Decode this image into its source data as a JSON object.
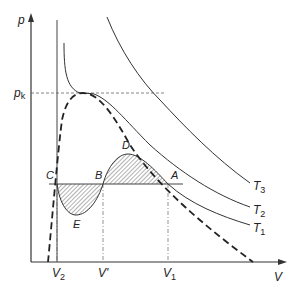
{
  "diagram": {
    "axes": {
      "y_label": "p",
      "x_label": "V",
      "pk_label": "p",
      "pk_sub": "k"
    },
    "x_ticks": [
      {
        "label": "V",
        "sub": "2"
      },
      {
        "label": "V'",
        "sub": ""
      },
      {
        "label": "V",
        "sub": "1"
      }
    ],
    "points": {
      "A": "A",
      "B": "B",
      "C": "C",
      "D": "D",
      "E": "E"
    },
    "isotherms": [
      {
        "label": "T",
        "sub": "3"
      },
      {
        "label": "T",
        "sub": "2"
      },
      {
        "label": "T",
        "sub": "1"
      }
    ],
    "colors": {
      "line": "#333333",
      "hatch": "#555555",
      "background": "#ffffff"
    }
  }
}
